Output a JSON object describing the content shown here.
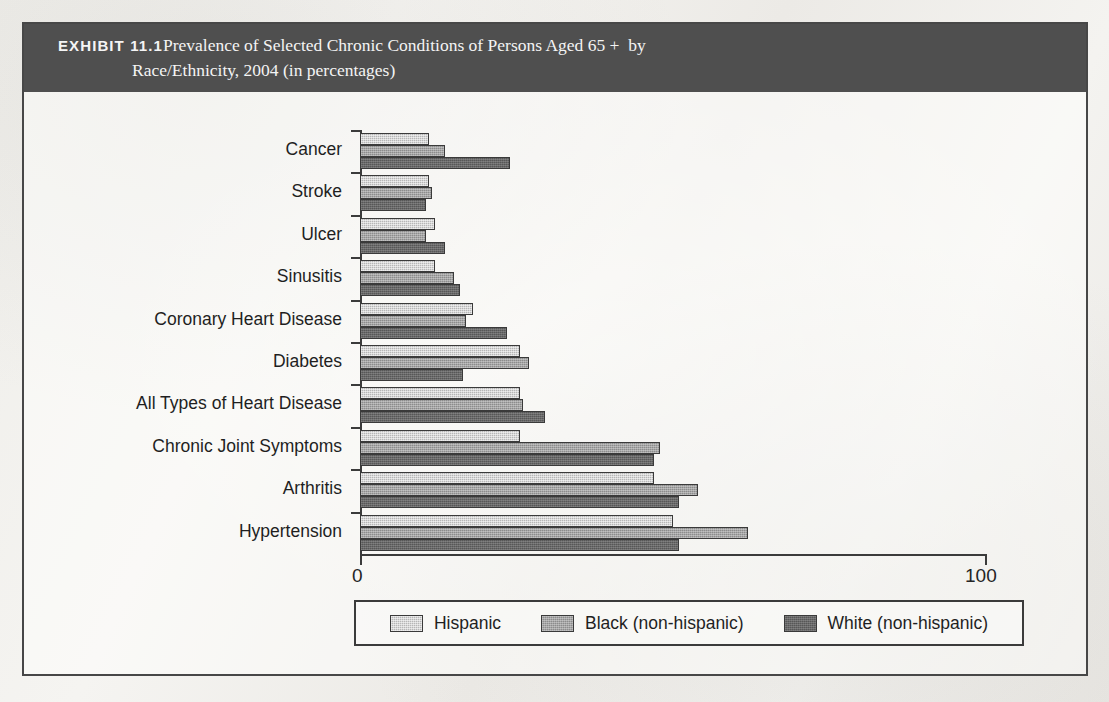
{
  "exhibit": {
    "label": "EXHIBIT 11.1",
    "title_line1": "Prevalence of Selected Chronic Conditions of Persons Aged 65 +  by",
    "title_line2": "Race/Ethnicity, 2004 (in percentages)",
    "header_background": "#4f4f4f",
    "header_text_color": "#ffffff"
  },
  "chart_data": {
    "type": "bar",
    "orientation": "horizontal",
    "title": "Prevalence of Selected Chronic Conditions of Persons Aged 65 + by Race/Ethnicity, 2004 (in percentages)",
    "xlabel": "",
    "ylabel": "",
    "xlim": [
      0,
      100
    ],
    "xticks": [
      0,
      100
    ],
    "xticklabels": [
      "0",
      "100"
    ],
    "grid": false,
    "legend_position": "bottom",
    "categories": [
      "Cancer",
      "Stroke",
      "Ulcer",
      "Sinusitis",
      "Coronary Heart Disease",
      "Diabetes",
      "All Types of Heart Disease",
      "Chronic Joint Symptoms",
      "Arthritis",
      "Hypertension"
    ],
    "series": [
      {
        "name": "Hispanic",
        "color": "#b6b6b6",
        "values": [
          11,
          11,
          12,
          12,
          18,
          25.5,
          25.5,
          25.5,
          47,
          50
        ]
      },
      {
        "name": "Black (non-hispanic)",
        "color": "#8c8c8c",
        "values": [
          13.5,
          11.5,
          10.5,
          15,
          17,
          27,
          26,
          48,
          54,
          62
        ]
      },
      {
        "name": "White (non-hispanic)",
        "color": "#575757",
        "values": [
          24,
          10.5,
          13.5,
          16,
          23.5,
          16.5,
          29.5,
          47,
          51,
          51
        ]
      }
    ]
  }
}
